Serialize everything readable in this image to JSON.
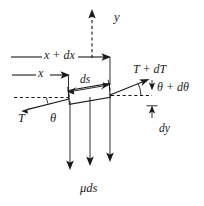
{
  "figure": {
    "kind": "free-body-diagram-of-string-element",
    "background_color": "#ffffff",
    "ink_color": "#1a1a1a",
    "width": 204,
    "height": 206,
    "labels": {
      "y_axis": "y",
      "x_plus_dx": "x + dx",
      "x": "x",
      "ds": "ds",
      "tension_right": "T + dT",
      "angle_right": "θ + dθ",
      "dy": "dy",
      "tension_left": "T",
      "angle_left": "θ",
      "weight": "μds"
    },
    "elements": [
      {
        "name": "y-axis-dashed-arrow",
        "type": "dashed-arrow",
        "from": [
          92,
          58
        ],
        "to": [
          92,
          11
        ],
        "direction": "up"
      },
      {
        "name": "x-plus-dx-dimension-arrow",
        "type": "arrow",
        "from": [
          11,
          57
        ],
        "to": [
          110,
          57
        ],
        "direction": "right"
      },
      {
        "name": "x-dimension-arrow",
        "type": "arrow",
        "from": [
          12,
          75
        ],
        "to": [
          70,
          75
        ],
        "direction": "right"
      },
      {
        "name": "ds-dimension-arrow",
        "type": "double-arrow",
        "from": [
          68,
          92
        ],
        "to": [
          109,
          85
        ]
      },
      {
        "name": "string-element",
        "type": "slanted-quadrilateral",
        "corners": [
          [
            68,
            90
          ],
          [
            109,
            83
          ],
          [
            110,
            97
          ],
          [
            69,
            104
          ]
        ]
      },
      {
        "name": "tension-right-arrow",
        "type": "arrow",
        "from": [
          109,
          95
        ],
        "to": [
          149,
          79
        ],
        "direction": "up-right"
      },
      {
        "name": "tension-left-arrow",
        "type": "arrow",
        "from": [
          70,
          99
        ],
        "to": [
          22,
          111
        ],
        "direction": "down-left"
      },
      {
        "name": "horizontal-reference-dashed-left",
        "type": "dashed-line",
        "from": [
          14,
          98
        ],
        "to": [
          70,
          98
        ]
      },
      {
        "name": "horizontal-reference-dashed-right",
        "type": "dashed-line",
        "from": [
          110,
          95
        ],
        "to": [
          160,
          95
        ]
      },
      {
        "name": "angle-arc-right",
        "type": "arc"
      },
      {
        "name": "dy-dimension",
        "type": "double-ended-vertical-dimension",
        "top": [
          152,
          82
        ],
        "bottom": [
          152,
          118
        ]
      },
      {
        "name": "weight-arrow-1",
        "type": "arrow",
        "from": [
          70,
          100
        ],
        "to": [
          70,
          170
        ],
        "direction": "down"
      },
      {
        "name": "weight-arrow-2",
        "type": "arrow",
        "from": [
          90,
          95
        ],
        "to": [
          90,
          170
        ],
        "direction": "down"
      },
      {
        "name": "weight-arrow-3",
        "type": "arrow",
        "from": [
          110,
          92
        ],
        "to": [
          110,
          170
        ],
        "direction": "down"
      }
    ]
  }
}
